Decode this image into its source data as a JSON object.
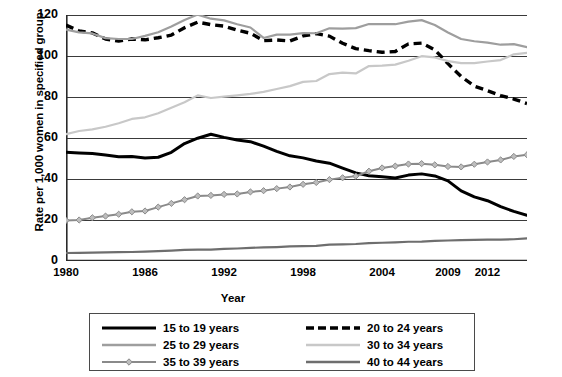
{
  "chart_data": {
    "type": "line",
    "title": "",
    "xlabel": "Year",
    "ylabel": "Rate per 1,000 women in specified group",
    "xlim": [
      1980,
      2015
    ],
    "ylim": [
      0,
      120
    ],
    "ytick_step": 20,
    "grid": "horizontal",
    "legend_position": "bottom",
    "yticks": [
      "0",
      "20",
      "40",
      "60",
      "80",
      "100",
      "120"
    ],
    "xticks": [
      "1980",
      "1986",
      "1992",
      "1998",
      "2004",
      "2009",
      "2012"
    ],
    "xtick_years": [
      1980,
      1986,
      1992,
      1998,
      2004,
      2009,
      2012
    ],
    "x": [
      1980,
      1981,
      1982,
      1983,
      1984,
      1985,
      1986,
      1987,
      1988,
      1989,
      1990,
      1991,
      1992,
      1993,
      1994,
      1995,
      1996,
      1997,
      1998,
      1999,
      2000,
      2001,
      2002,
      2003,
      2004,
      2005,
      2006,
      2007,
      2008,
      2009,
      2010,
      2011,
      2012,
      2013,
      2014,
      2015
    ],
    "series": [
      {
        "name": "15 to 19 years",
        "color": "#000000",
        "style": "solid-thick",
        "marker": "none",
        "values": [
          53.0,
          52.7,
          52.4,
          51.7,
          50.9,
          51.0,
          50.2,
          50.6,
          53.0,
          57.3,
          59.9,
          61.8,
          60.3,
          59.0,
          58.2,
          56.0,
          53.5,
          51.3,
          50.3,
          48.8,
          47.7,
          45.3,
          43.0,
          41.6,
          41.1,
          40.5,
          41.9,
          42.5,
          41.5,
          39.1,
          34.2,
          31.3,
          29.4,
          26.5,
          24.2,
          22.3
        ]
      },
      {
        "name": "20 to 24 years",
        "color": "#000000",
        "style": "dashed",
        "marker": "none",
        "values": [
          115.1,
          112.2,
          111.3,
          108.3,
          107.3,
          108.3,
          107.9,
          108.9,
          110.2,
          113.8,
          116.5,
          115.3,
          114.6,
          112.6,
          111.1,
          107.5,
          107.8,
          107.3,
          109.8,
          110.9,
          109.7,
          106.2,
          103.6,
          102.6,
          101.8,
          102.2,
          105.9,
          106.3,
          103.0,
          96.3,
          90.0,
          85.3,
          83.1,
          80.7,
          79.0,
          76.8
        ]
      },
      {
        "name": "25 to 29 years",
        "color": "#9e9e9e",
        "style": "solid",
        "marker": "none",
        "values": [
          112.9,
          111.5,
          111.0,
          108.7,
          108.3,
          108.3,
          109.8,
          111.6,
          114.4,
          117.6,
          120.2,
          118.2,
          117.4,
          115.5,
          113.9,
          108.8,
          110.4,
          110.4,
          111.2,
          111.1,
          113.5,
          113.4,
          113.6,
          115.6,
          115.5,
          115.5,
          116.8,
          117.5,
          115.1,
          111.5,
          108.3,
          107.2,
          106.5,
          105.5,
          105.8,
          104.3
        ]
      },
      {
        "name": "30 to 34 years",
        "color": "#c8c8c8",
        "style": "solid",
        "marker": "none",
        "values": [
          61.9,
          63.4,
          64.2,
          65.5,
          67.2,
          69.3,
          70.1,
          72.1,
          74.8,
          77.4,
          80.8,
          79.5,
          80.2,
          80.8,
          81.5,
          82.5,
          83.9,
          85.3,
          87.4,
          87.8,
          91.2,
          91.9,
          91.5,
          95.1,
          95.3,
          95.8,
          97.7,
          99.9,
          99.3,
          97.5,
          96.5,
          96.5,
          97.3,
          98.0,
          100.8,
          101.5
        ]
      },
      {
        "name": "35 to 39 years",
        "color": "#8a8a8a",
        "style": "solid-marker",
        "marker": "diamond",
        "values": [
          19.8,
          20.0,
          21.1,
          21.9,
          22.8,
          24.0,
          24.4,
          26.3,
          28.1,
          29.9,
          31.7,
          32.0,
          32.5,
          32.7,
          33.7,
          34.3,
          35.3,
          36.1,
          37.4,
          38.3,
          39.7,
          40.6,
          41.4,
          43.8,
          45.4,
          46.3,
          47.3,
          47.5,
          46.9,
          46.1,
          45.9,
          47.2,
          48.3,
          49.3,
          51.0,
          51.8
        ]
      },
      {
        "name": "40 to 44 years",
        "color": "#6e6e6e",
        "style": "solid",
        "marker": "none",
        "values": [
          3.9,
          4.0,
          4.1,
          4.2,
          4.3,
          4.4,
          4.6,
          4.8,
          5.1,
          5.4,
          5.5,
          5.5,
          5.9,
          6.1,
          6.4,
          6.6,
          6.8,
          7.1,
          7.3,
          7.4,
          8.0,
          8.1,
          8.3,
          8.7,
          8.9,
          9.1,
          9.4,
          9.5,
          9.8,
          10.0,
          10.2,
          10.3,
          10.4,
          10.4,
          10.6,
          11.0
        ]
      }
    ]
  },
  "axes": {
    "y_title": "Rate per 1,000 women in specified group",
    "x_title": "Year"
  },
  "legend": {
    "items": [
      {
        "label": "15 to 19 years",
        "style": "solid-thick",
        "color": "#000000"
      },
      {
        "label": "20 to 24 years",
        "style": "dashed",
        "color": "#000000"
      },
      {
        "label": "25 to 29 years",
        "style": "solid",
        "color": "#9e9e9e"
      },
      {
        "label": "30 to 34 years",
        "style": "solid",
        "color": "#c8c8c8"
      },
      {
        "label": "35 to 39 years",
        "style": "solid-marker",
        "color": "#8a8a8a"
      },
      {
        "label": "40 to 44 years",
        "style": "solid",
        "color": "#6e6e6e"
      }
    ]
  }
}
